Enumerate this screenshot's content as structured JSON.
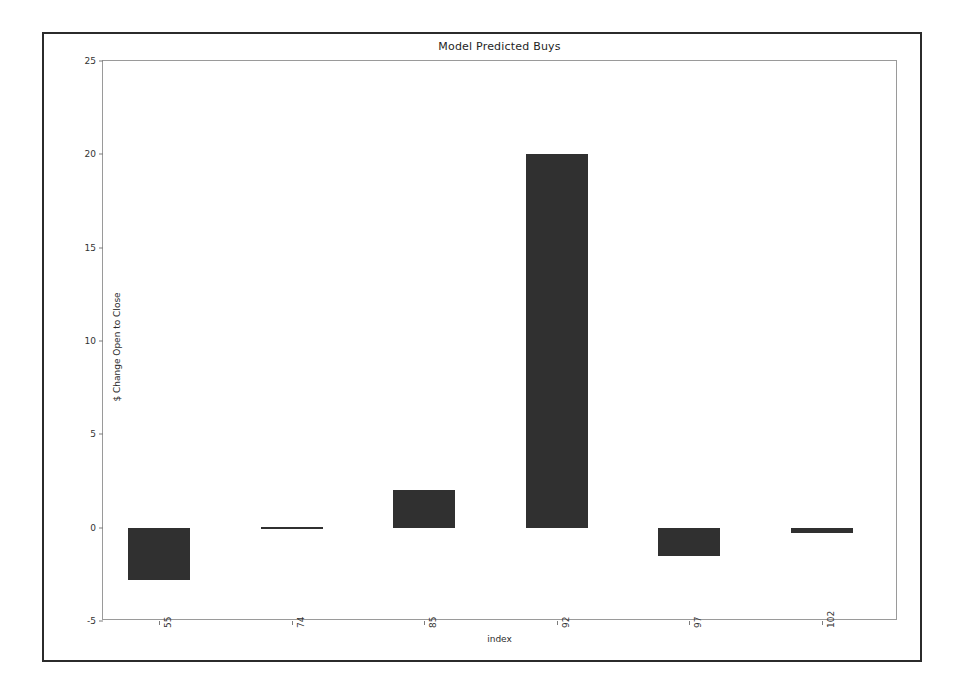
{
  "chart_data": {
    "type": "bar",
    "title": "Model Predicted Buys",
    "xlabel": "index",
    "ylabel": "$ Change Open to Close",
    "categories": [
      "55",
      "74",
      "85",
      "92",
      "97",
      "102"
    ],
    "values": [
      -2.8,
      0.05,
      2.0,
      20.0,
      -1.5,
      -0.3
    ],
    "series": [
      {
        "name": "$ Change Open to Close",
        "values": [
          -2.8,
          0.05,
          2.0,
          20.0,
          -1.5,
          -0.3
        ]
      }
    ],
    "ylim": [
      -5,
      25
    ],
    "yticks": [
      25,
      20,
      15,
      10,
      5,
      0,
      -5
    ],
    "ytick_labels": [
      "25",
      "20",
      "15",
      "10",
      "5",
      "0",
      "-5"
    ],
    "xtick_labels": [
      "55",
      "74",
      "85",
      "92",
      "97",
      "102"
    ],
    "grid": false,
    "legend": null,
    "bar_color": "#303030",
    "background_color": "#ffffff",
    "axis_color": "#9a9a9a",
    "frame_color": "#2b2b2b"
  }
}
